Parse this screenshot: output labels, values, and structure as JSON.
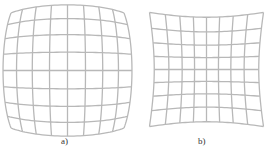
{
  "figure": {
    "panels": [
      {
        "id": "a",
        "label": "a)",
        "distortion": "pincushion",
        "grid_lines": 9,
        "center": [
          67.5,
          70.5
        ],
        "half_size": [
          56.5,
          57.5
        ],
        "k": -0.11
      },
      {
        "id": "b",
        "label": "b)",
        "distortion": "barrel",
        "grid_lines": 9,
        "center": [
          206.5,
          69.5
        ],
        "half_size": [
          57,
          57
        ],
        "k": 0.1
      }
    ],
    "line_color": "#b8b8b8",
    "line_width": 1.3
  }
}
